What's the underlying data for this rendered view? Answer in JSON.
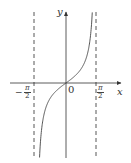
{
  "chart_data": {
    "type": "line",
    "title": "",
    "function": "y = tan(x)",
    "xlabel": "x",
    "ylabel": "y",
    "origin_label": "0",
    "x_ticks": [
      {
        "value": -1.5708,
        "label": "-π/2",
        "num": "π",
        "den": "2",
        "sign": "−"
      },
      {
        "value": 1.5708,
        "label": "π/2",
        "num": "π",
        "den": "2",
        "sign": ""
      }
    ],
    "asymptotes": [
      {
        "x": -1.5708,
        "style": "dashed"
      },
      {
        "x": 1.5708,
        "style": "dashed"
      }
    ],
    "series": [
      {
        "name": "tan x",
        "x": [
          -1.45,
          -1.3,
          -1.0,
          -0.6,
          -0.3,
          0,
          0.3,
          0.6,
          1.0,
          1.3,
          1.45
        ],
        "y": [
          -8.2,
          -3.6,
          -1.56,
          -0.68,
          -0.31,
          0,
          0.31,
          0.68,
          1.56,
          3.6,
          8.2
        ]
      }
    ],
    "xlim": [
      -2.6,
      2.6
    ],
    "grid": false,
    "legend": "none"
  }
}
